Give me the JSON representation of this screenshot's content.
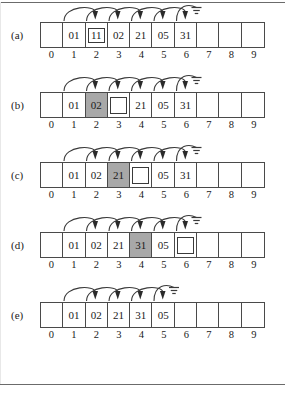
{
  "figure": {
    "title": "",
    "panel_count": 5,
    "array_size": 10,
    "index_labels": [
      "0",
      "1",
      "2",
      "3",
      "4",
      "5",
      "6",
      "7",
      "8",
      "9"
    ],
    "colors": {
      "highlight_gray": "#a8a8a8",
      "cell_border": "#4a4a4a",
      "arc_stroke": "#3a3a3a",
      "page_background": "#ffffff",
      "rule": "#6b6b6b"
    }
  },
  "panels": [
    {
      "label": "(a)",
      "cells": [
        {
          "value": "",
          "style": "empty"
        },
        {
          "value": "01",
          "style": "plain"
        },
        {
          "value": "11",
          "style": "boxed"
        },
        {
          "value": "02",
          "style": "plain"
        },
        {
          "value": "21",
          "style": "plain"
        },
        {
          "value": "05",
          "style": "plain"
        },
        {
          "value": "31",
          "style": "plain"
        },
        {
          "value": "",
          "style": "empty"
        },
        {
          "value": "",
          "style": "empty"
        },
        {
          "value": "",
          "style": "empty"
        }
      ],
      "arcs": [
        {
          "from_index": 1,
          "to_index": 2,
          "kind": "arrow"
        },
        {
          "from_index": 2,
          "to_index": 3,
          "kind": "arrow"
        },
        {
          "from_index": 3,
          "to_index": 4,
          "kind": "arrow"
        },
        {
          "from_index": 4,
          "to_index": 5,
          "kind": "arrow"
        },
        {
          "from_index": 5,
          "to_index": 6,
          "kind": "arrow"
        },
        {
          "from_index": 6,
          "to_index": 7,
          "kind": "ground"
        }
      ]
    },
    {
      "label": "(b)",
      "cells": [
        {
          "value": "",
          "style": "empty"
        },
        {
          "value": "01",
          "style": "plain"
        },
        {
          "value": "02",
          "style": "gray"
        },
        {
          "value": "",
          "style": "hole"
        },
        {
          "value": "21",
          "style": "plain"
        },
        {
          "value": "05",
          "style": "plain"
        },
        {
          "value": "31",
          "style": "plain"
        },
        {
          "value": "",
          "style": "empty"
        },
        {
          "value": "",
          "style": "empty"
        },
        {
          "value": "",
          "style": "empty"
        }
      ],
      "arcs": [
        {
          "from_index": 1,
          "to_index": 2,
          "kind": "arrow"
        },
        {
          "from_index": 2,
          "to_index": 3,
          "kind": "arrow"
        },
        {
          "from_index": 3,
          "to_index": 4,
          "kind": "arrow"
        },
        {
          "from_index": 4,
          "to_index": 5,
          "kind": "arrow"
        },
        {
          "from_index": 5,
          "to_index": 6,
          "kind": "arrow"
        },
        {
          "from_index": 6,
          "to_index": 7,
          "kind": "ground"
        }
      ]
    },
    {
      "label": "(c)",
      "cells": [
        {
          "value": "",
          "style": "empty"
        },
        {
          "value": "01",
          "style": "plain"
        },
        {
          "value": "02",
          "style": "plain"
        },
        {
          "value": "21",
          "style": "gray"
        },
        {
          "value": "",
          "style": "hole"
        },
        {
          "value": "05",
          "style": "plain"
        },
        {
          "value": "31",
          "style": "plain"
        },
        {
          "value": "",
          "style": "empty"
        },
        {
          "value": "",
          "style": "empty"
        },
        {
          "value": "",
          "style": "empty"
        }
      ],
      "arcs": [
        {
          "from_index": 1,
          "to_index": 2,
          "kind": "arrow"
        },
        {
          "from_index": 2,
          "to_index": 3,
          "kind": "arrow"
        },
        {
          "from_index": 3,
          "to_index": 4,
          "kind": "arrow"
        },
        {
          "from_index": 4,
          "to_index": 5,
          "kind": "arrow"
        },
        {
          "from_index": 5,
          "to_index": 6,
          "kind": "arrow"
        },
        {
          "from_index": 6,
          "to_index": 7,
          "kind": "ground"
        }
      ]
    },
    {
      "label": "(d)",
      "cells": [
        {
          "value": "",
          "style": "empty"
        },
        {
          "value": "01",
          "style": "plain"
        },
        {
          "value": "02",
          "style": "plain"
        },
        {
          "value": "21",
          "style": "plain"
        },
        {
          "value": "31",
          "style": "gray"
        },
        {
          "value": "05",
          "style": "plain"
        },
        {
          "value": "",
          "style": "hole"
        },
        {
          "value": "",
          "style": "empty"
        },
        {
          "value": "",
          "style": "empty"
        },
        {
          "value": "",
          "style": "empty"
        }
      ],
      "arcs": [
        {
          "from_index": 1,
          "to_index": 2,
          "kind": "arrow"
        },
        {
          "from_index": 2,
          "to_index": 3,
          "kind": "arrow"
        },
        {
          "from_index": 3,
          "to_index": 4,
          "kind": "arrow"
        },
        {
          "from_index": 4,
          "to_index": 5,
          "kind": "arrow"
        },
        {
          "from_index": 5,
          "to_index": 6,
          "kind": "arrow"
        },
        {
          "from_index": 6,
          "to_index": 7,
          "kind": "ground"
        }
      ]
    },
    {
      "label": "(e)",
      "cells": [
        {
          "value": "",
          "style": "empty"
        },
        {
          "value": "01",
          "style": "plain"
        },
        {
          "value": "02",
          "style": "plain"
        },
        {
          "value": "21",
          "style": "plain"
        },
        {
          "value": "31",
          "style": "plain"
        },
        {
          "value": "05",
          "style": "plain"
        },
        {
          "value": "",
          "style": "empty"
        },
        {
          "value": "",
          "style": "empty"
        },
        {
          "value": "",
          "style": "empty"
        },
        {
          "value": "",
          "style": "empty"
        }
      ],
      "arcs": [
        {
          "from_index": 1,
          "to_index": 2,
          "kind": "arrow"
        },
        {
          "from_index": 2,
          "to_index": 3,
          "kind": "arrow"
        },
        {
          "from_index": 3,
          "to_index": 4,
          "kind": "arrow"
        },
        {
          "from_index": 4,
          "to_index": 5,
          "kind": "arrow"
        },
        {
          "from_index": 5,
          "to_index": 6,
          "kind": "ground"
        }
      ]
    }
  ]
}
